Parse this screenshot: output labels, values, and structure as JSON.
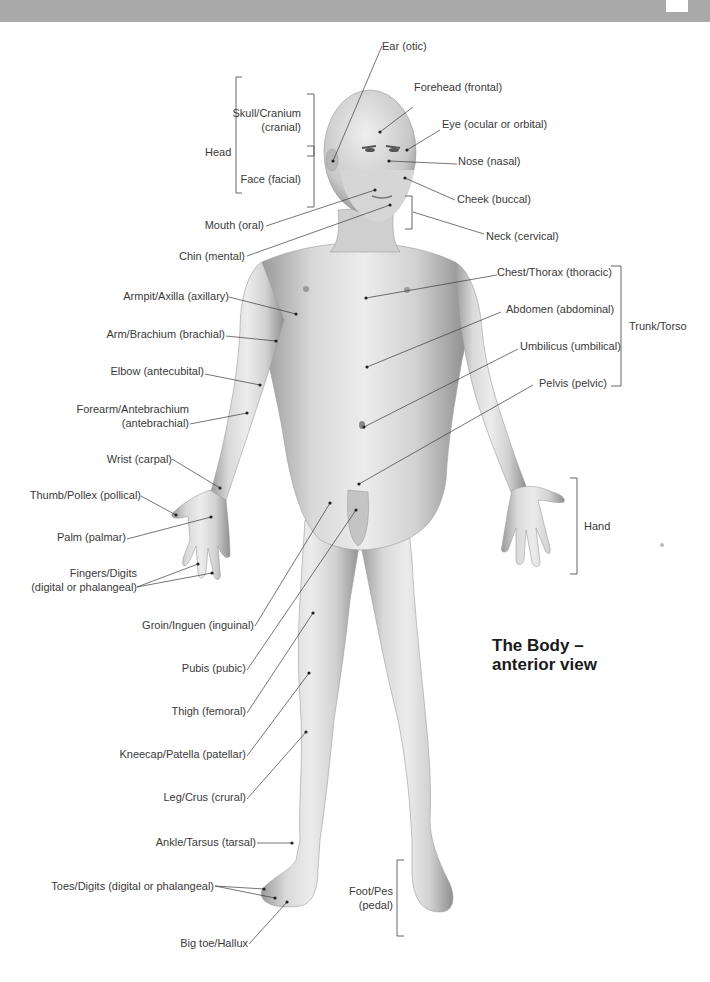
{
  "page": {
    "header_band_color": "#a9a9a9"
  },
  "title": {
    "line1": "The Body –",
    "line2": "anterior view"
  },
  "groups": {
    "head": "Head",
    "trunk": "Trunk/Torso",
    "hand": "Hand",
    "foot_line1": "Foot/Pes",
    "foot_line2": "(pedal)"
  },
  "labels_left": {
    "skull_line1": "Skull/Cranium",
    "skull_line2": "(cranial)",
    "face": "Face (facial)",
    "mouth": "Mouth (oral)",
    "chin": "Chin (mental)",
    "armpit": "Armpit/Axilla (axillary)",
    "arm": "Arm/Brachium (brachial)",
    "elbow": "Elbow (antecubital)",
    "forearm_line1": "Forearm/Antebrachium",
    "forearm_line2": "(antebrachial)",
    "wrist": "Wrist (carpal)",
    "thumb": "Thumb/Pollex (pollical)",
    "palm": "Palm (palmar)",
    "fingers_line1": "Fingers/Digits",
    "fingers_line2": "(digital or phalangeal)",
    "groin": "Groin/Inguen (inguinal)",
    "pubis": "Pubis (pubic)",
    "thigh": "Thigh (femoral)",
    "kneecap": "Kneecap/Patella (patellar)",
    "leg": "Leg/Crus (crural)",
    "ankle": "Ankle/Tarsus (tarsal)",
    "toes": "Toes/Digits (digital or phalangeal)",
    "big_toe": "Big toe/Hallux"
  },
  "labels_right": {
    "ear": "Ear (otic)",
    "forehead": "Forehead (frontal)",
    "eye": "Eye (ocular or orbital)",
    "nose": "Nose (nasal)",
    "cheek": "Cheek (buccal)",
    "neck": "Neck (cervical)",
    "chest": "Chest/Thorax (thoracic)",
    "abdomen": "Abdomen (abdominal)",
    "umbilicus": "Umbilicus (umbilical)",
    "pelvis": "Pelvis (pelvic)"
  }
}
